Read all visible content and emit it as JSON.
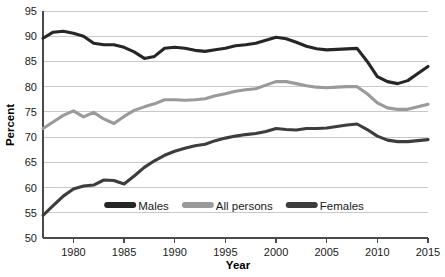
{
  "chart_data": {
    "type": "line",
    "title": "",
    "xlabel": "Year",
    "ylabel": "Percent",
    "xlim": [
      1977,
      2015
    ],
    "ylim": [
      50,
      95
    ],
    "ytick_step": 5,
    "xtick_step": 5,
    "grid": true,
    "legend_position": "bottom-center",
    "xticks": [
      "1980",
      "1985",
      "1990",
      "1995",
      "2000",
      "2005",
      "2010",
      "2015"
    ],
    "xtick_values": [
      1980,
      1985,
      1990,
      1995,
      2000,
      2005,
      2010,
      2015
    ],
    "yticks": [
      "50",
      "55",
      "60",
      "65",
      "70",
      "75",
      "80",
      "85",
      "90",
      "95"
    ],
    "ytick_values": [
      50,
      55,
      60,
      65,
      70,
      75,
      80,
      85,
      90,
      95
    ],
    "x": [
      1977,
      1978,
      1979,
      1980,
      1981,
      1982,
      1983,
      1984,
      1985,
      1986,
      1987,
      1988,
      1989,
      1990,
      1991,
      1992,
      1993,
      1994,
      1995,
      1996,
      1997,
      1998,
      1999,
      2000,
      2001,
      2002,
      2003,
      2004,
      2005,
      2006,
      2007,
      2008,
      2009,
      2010,
      2011,
      2012,
      2013,
      2014,
      2015
    ],
    "series": [
      {
        "name": "Males",
        "color": "#262626",
        "values": [
          89.6,
          90.8,
          91.0,
          90.6,
          90.0,
          88.6,
          88.3,
          88.3,
          87.8,
          86.9,
          85.6,
          86.0,
          87.6,
          87.8,
          87.6,
          87.2,
          87.0,
          87.3,
          87.6,
          88.1,
          88.3,
          88.6,
          89.2,
          89.8,
          89.5,
          88.8,
          88.0,
          87.5,
          87.3,
          87.4,
          87.5,
          87.6,
          85.0,
          82.0,
          81.0,
          80.6,
          81.2,
          82.6,
          84.0
        ]
      },
      {
        "name": "All persons",
        "color": "#9a9a9a",
        "values": [
          71.7,
          73.0,
          74.3,
          75.2,
          74.0,
          74.9,
          73.6,
          72.7,
          74.1,
          75.3,
          76.0,
          76.6,
          77.4,
          77.4,
          77.3,
          77.4,
          77.6,
          78.2,
          78.6,
          79.1,
          79.4,
          79.6,
          80.3,
          81.0,
          81.0,
          80.6,
          80.2,
          79.9,
          79.8,
          79.9,
          80.0,
          80.0,
          78.6,
          76.8,
          75.8,
          75.5,
          75.5,
          76.0,
          76.5
        ]
      },
      {
        "name": "Females",
        "color": "#3d3d3d",
        "values": [
          54.5,
          56.4,
          58.3,
          59.7,
          60.3,
          60.5,
          61.5,
          61.4,
          60.7,
          62.3,
          64.0,
          65.3,
          66.4,
          67.2,
          67.8,
          68.3,
          68.6,
          69.3,
          69.8,
          70.2,
          70.5,
          70.7,
          71.1,
          71.7,
          71.5,
          71.4,
          71.7,
          71.7,
          71.8,
          72.1,
          72.4,
          72.6,
          71.5,
          70.2,
          69.4,
          69.1,
          69.1,
          69.3,
          69.5
        ]
      }
    ]
  },
  "legend": {
    "items": [
      {
        "label": "Males",
        "color": "#262626"
      },
      {
        "label": "All persons",
        "color": "#9a9a9a"
      },
      {
        "label": "Females",
        "color": "#3d3d3d"
      }
    ]
  }
}
